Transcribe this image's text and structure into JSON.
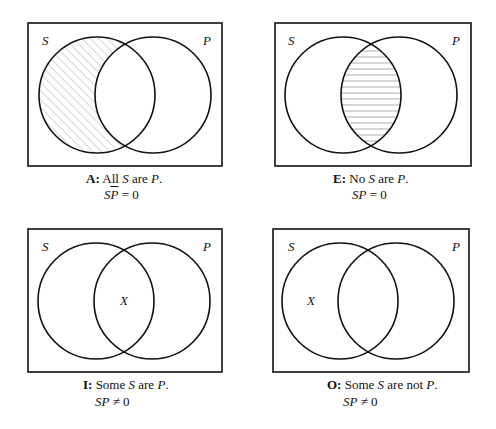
{
  "panels": [
    {
      "id": "A",
      "label_s": "S",
      "label_p": "P",
      "shading": "S-only region hatched diagonally",
      "caption_letter": "A:",
      "caption_pre": "All",
      "caption_s": "S",
      "caption_mid": "are",
      "caption_p": "P",
      "caption_end": ".",
      "formula_s": "S",
      "formula_p": "P",
      "formula_op": "= 0",
      "formula_p_overbar": true
    },
    {
      "id": "E",
      "label_s": "S",
      "label_p": "P",
      "shading": "intersection hatched horizontally",
      "caption_letter": "E:",
      "caption_pre": "No",
      "caption_s": "S",
      "caption_mid": "are",
      "caption_p": "P",
      "caption_end": ".",
      "formula_s": "S",
      "formula_p": "P",
      "formula_op": "= 0"
    },
    {
      "id": "I",
      "label_s": "S",
      "label_p": "P",
      "mark": "X",
      "caption_letter": "I:",
      "caption_pre": "Some",
      "caption_s": "S",
      "caption_mid": "are",
      "caption_p": "P",
      "caption_end": ".",
      "formula_s": "S",
      "formula_p": "P",
      "formula_op": "≠ 0"
    },
    {
      "id": "O",
      "label_s": "S",
      "label_p": "P",
      "mark": "X",
      "caption_letter": "O:",
      "caption_pre": "Some",
      "caption_s": "S",
      "caption_mid": "are not",
      "caption_p": "P",
      "caption_end": ".",
      "formula_s": "S",
      "formula_p": "P",
      "formula_op": "≠ 0"
    }
  ],
  "colors": {
    "stroke": "#111111",
    "hatch": "#999999"
  }
}
